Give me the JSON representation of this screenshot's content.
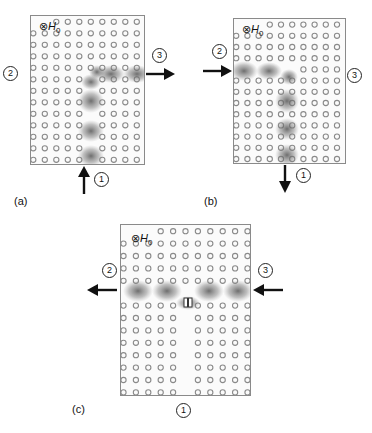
{
  "figure": {
    "panels": [
      {
        "id": "a",
        "caption": "(a)",
        "field_label": {
          "symbol": "⊗",
          "name": "H",
          "subscript": "0"
        },
        "ports": {
          "p1": "1",
          "p2": "2",
          "p3": "3"
        },
        "description": "Input at port 1 (bottom, arrow up), output at port 3 (right, arrow right)"
      },
      {
        "id": "b",
        "caption": "(b)",
        "field_label": {
          "symbol": "⊗",
          "name": "H",
          "subscript": "0"
        },
        "ports": {
          "p1": "1",
          "p2": "2",
          "p3": "3"
        },
        "description": "Input at port 2 (left, arrow right), output at port 1 (bottom, arrow down)"
      },
      {
        "id": "c",
        "caption": "(c)",
        "field_label": {
          "symbol": "⊗",
          "name": "H",
          "subscript": "0"
        },
        "ports": {
          "p1": "1",
          "p2": "2",
          "p3": "3"
        },
        "description": "Input at port 3 (right, arrow left), output at port 2 (left, arrow left)"
      }
    ],
    "colors": {
      "rod": "#8a8a8a",
      "field": "#555555",
      "border": "#8a8a8a",
      "arrow": "#111111"
    }
  }
}
